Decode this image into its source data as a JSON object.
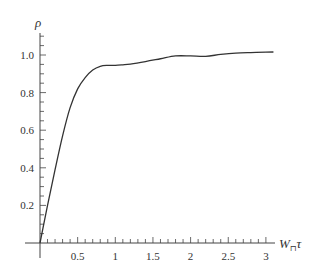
{
  "chart_data": {
    "type": "line",
    "title": "",
    "xlabel": "W⊓τ",
    "ylabel": "ρ",
    "xlim": [
      0,
      3.25
    ],
    "ylim": [
      0,
      1.1
    ],
    "grid": false,
    "legend": null,
    "x_ticks": [
      0.5,
      1,
      1.5,
      2,
      2.5,
      3
    ],
    "x_tick_labels": [
      "0.5",
      "1",
      "1.5",
      "2",
      "2.5",
      "3"
    ],
    "y_ticks": [
      0.2,
      0.4,
      0.6,
      0.8,
      1.0
    ],
    "y_tick_labels": [
      "0.2",
      "0.4",
      "0.6",
      "0.8",
      "1.0"
    ],
    "series": [
      {
        "name": "rho",
        "color": "#333333",
        "x": [
          0,
          0.1,
          0.2,
          0.3,
          0.4,
          0.5,
          0.6,
          0.7,
          0.8,
          0.9,
          1.0,
          1.1,
          1.2,
          1.4,
          1.6,
          1.8,
          2.0,
          2.2,
          2.4,
          2.6,
          2.8,
          3.0,
          3.1
        ],
        "values": [
          0.0,
          0.2,
          0.39,
          0.57,
          0.72,
          0.82,
          0.88,
          0.92,
          0.94,
          0.945,
          0.945,
          0.948,
          0.952,
          0.965,
          0.98,
          0.995,
          0.995,
          0.993,
          1.003,
          1.01,
          1.013,
          1.015,
          1.016
        ]
      }
    ]
  },
  "labels": {
    "y_axis": "ρ",
    "x_axis_main": "W",
    "x_axis_sub": "⊓",
    "x_axis_tail": "τ"
  }
}
